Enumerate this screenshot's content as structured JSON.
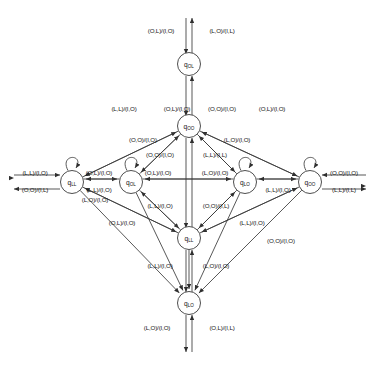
{
  "diagram": {
    "kind": "finite-state-machine",
    "notation": "(input1,input2)/(output1,output2)",
    "symbols": [
      "O",
      "L",
      "I"
    ],
    "node_radius": 11.5,
    "states": [
      {
        "id": "q_OL_top",
        "label": "q",
        "sub": "OL",
        "cx": 189,
        "cy": 64
      },
      {
        "id": "q_OO_upper",
        "label": "q",
        "sub": "OO",
        "cx": 189,
        "cy": 126
      },
      {
        "id": "q_LL_left",
        "label": "q",
        "sub": "LL",
        "cx": 72,
        "cy": 182
      },
      {
        "id": "q_OL_mid",
        "label": "q",
        "sub": "OL",
        "cx": 131,
        "cy": 182
      },
      {
        "id": "q_LO_mid",
        "label": "q",
        "sub": "LO",
        "cx": 245,
        "cy": 182
      },
      {
        "id": "q_OO_right",
        "label": "q",
        "sub": "OO",
        "cx": 310,
        "cy": 182
      },
      {
        "id": "q_LL_lower",
        "label": "q",
        "sub": "LL",
        "cx": 189,
        "cy": 238
      },
      {
        "id": "q_LO_bottom",
        "label": "q",
        "sub": "LO",
        "cx": 189,
        "cy": 303
      }
    ],
    "edge_labels": [
      {
        "text": "(O,L)/(I,O)",
        "x": 161,
        "y": 31
      },
      {
        "text": "(L,O)/(I,L)",
        "x": 222,
        "y": 31
      },
      {
        "text": "(L,L)/(I,O)",
        "x": 124,
        "y": 109
      },
      {
        "text": "(O,L)/(I,O)",
        "x": 177,
        "y": 109
      },
      {
        "text": "(O,O)/(I,O)",
        "x": 222,
        "y": 109
      },
      {
        "text": "(O,L)/(I,O)",
        "x": 272,
        "y": 109
      },
      {
        "text": "(O,O)/(I,O)",
        "x": 143,
        "y": 140
      },
      {
        "text": "(L,O)/(I,O)",
        "x": 237,
        "y": 140
      },
      {
        "text": "(O,O)/(I,O)",
        "x": 160,
        "y": 155
      },
      {
        "text": "(L,L)/(I,L)",
        "x": 215,
        "y": 155
      },
      {
        "text": "(L,L)/(I,O)",
        "x": 35,
        "y": 173
      },
      {
        "text": "(O,O)/(I,L)",
        "x": 35,
        "y": 190
      },
      {
        "text": "(O,L)/(I,O)",
        "x": 99,
        "y": 173
      },
      {
        "text": "(L,L)/(I,O)",
        "x": 99,
        "y": 190
      },
      {
        "text": "(O,L)/(I,O)",
        "x": 158,
        "y": 173
      },
      {
        "text": "(L,O)/(I,O)",
        "x": 215,
        "y": 173
      },
      {
        "text": "(L,L)/(I,O)",
        "x": 278,
        "y": 190
      },
      {
        "text": "(O,O)/(I,O)",
        "x": 344,
        "y": 173
      },
      {
        "text": "(L,L)/(I,L)",
        "x": 344,
        "y": 190
      },
      {
        "text": "(L,L)/(I,O)",
        "x": 160,
        "y": 206
      },
      {
        "text": "(O,O)/(I,L)",
        "x": 216,
        "y": 206
      },
      {
        "text": "(O,L)/(I,O)",
        "x": 122,
        "y": 223
      },
      {
        "text": "(L,L)/(I,O)",
        "x": 252,
        "y": 223
      },
      {
        "text": "(L,O)/(I,O)",
        "x": 95,
        "y": 200
      },
      {
        "text": "(O,O)/(I,O)",
        "x": 281,
        "y": 241
      },
      {
        "text": "(L,L)/(I,O)",
        "x": 160,
        "y": 266
      },
      {
        "text": "(L,O)/(I,O)",
        "x": 216,
        "y": 266
      },
      {
        "text": "(L,O)/(I,O)",
        "x": 157,
        "y": 328
      },
      {
        "text": "(O,L)/(I,L)",
        "x": 222,
        "y": 328
      }
    ],
    "colors": {
      "stroke": "#3a3a3a",
      "text": "#141414",
      "background": "#ffffff"
    }
  }
}
